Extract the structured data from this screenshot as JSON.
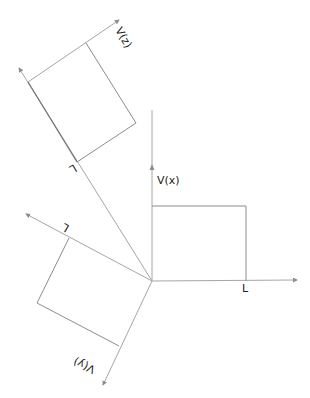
{
  "diagram": {
    "colors": {
      "axis": "#a6a6a6",
      "rect": "#8c8c8c",
      "text": "#222222"
    },
    "labels": {
      "vx": "V(x)",
      "vy": "V(y)",
      "vz": "V(z)",
      "L_x": "L",
      "L_y": "L",
      "L_z": "L"
    },
    "origin": [
      152,
      281
    ]
  }
}
